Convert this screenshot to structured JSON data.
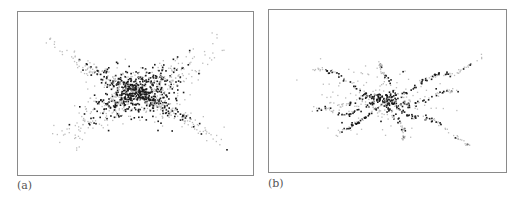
{
  "panels": [
    {
      "id": "a",
      "label": "(a)",
      "description": "Dense scatter of points forming an X / bow-tie pattern centered in the frame"
    },
    {
      "id": "b",
      "label": "(b)",
      "description": "Sparser scatter of points forming star-like radiating filaments from the center"
    }
  ],
  "colors": {
    "dot_dark": "#1a1a1a",
    "dot_light": "#bdbdbd",
    "frame": "#8a8a8a"
  },
  "chart_data": [
    {
      "type": "scatter",
      "title": "(a)",
      "xlabel": "",
      "ylabel": "",
      "grid": false,
      "pattern": "X-shaped dense cloud, densest at center, arms toward four corners",
      "approx_point_count": 1200
    },
    {
      "type": "scatter",
      "title": "(b)",
      "xlabel": "",
      "ylabel": "",
      "grid": false,
      "pattern": "Radiating filaments from center, main arm from lower-left to upper-right",
      "approx_point_count": 400
    }
  ]
}
